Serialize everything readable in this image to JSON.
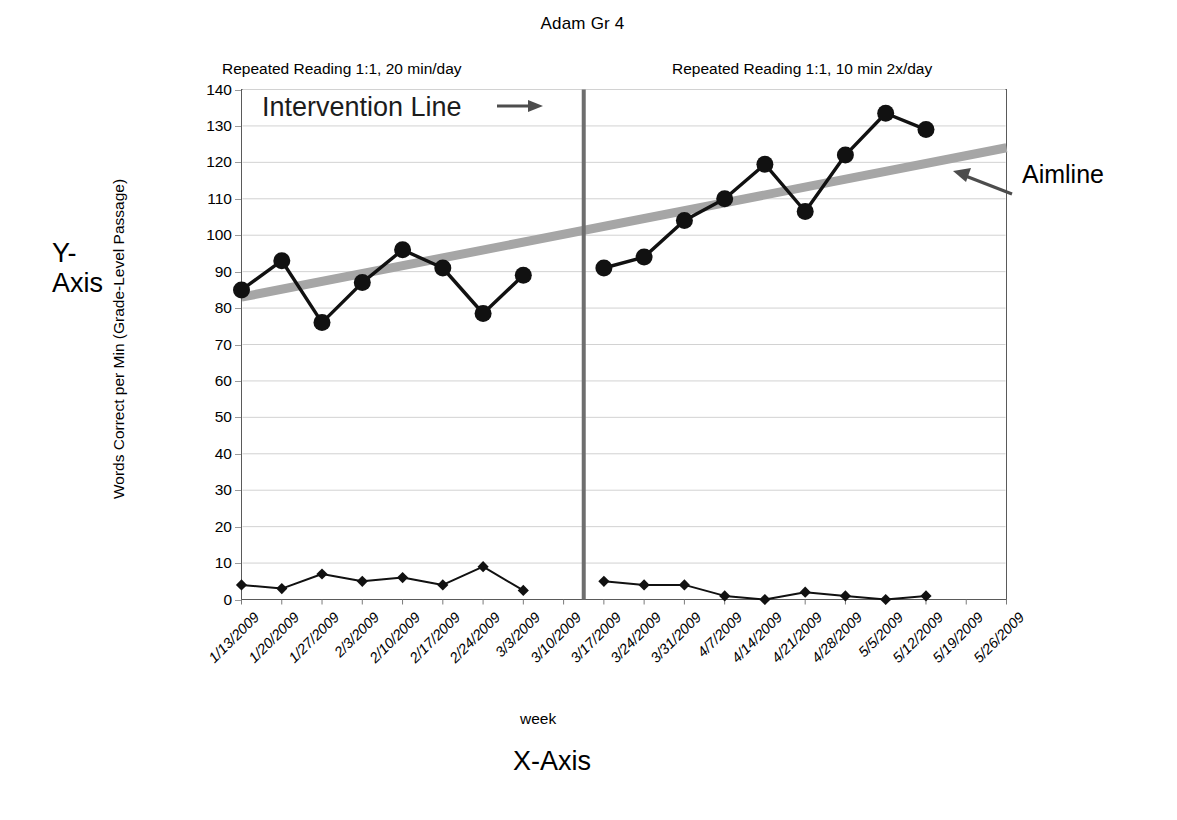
{
  "chart_data": {
    "type": "line",
    "title": "Adam Gr 4",
    "xlabel": "week",
    "ylabel": "Words Correct per Min (Grade-Level Passage)",
    "ylim": [
      0,
      140
    ],
    "ytick_step": 10,
    "yticks": [
      140,
      130,
      120,
      110,
      100,
      90,
      80,
      70,
      60,
      50,
      40,
      30,
      20,
      10,
      0
    ],
    "grid": true,
    "legend_position": "none",
    "categories": [
      "1/13/2009",
      "1/20/2009",
      "1/27/2009",
      "2/3/2009",
      "2/10/2009",
      "2/17/2009",
      "2/24/2009",
      "3/3/2009",
      "3/10/2009",
      "3/17/2009",
      "3/24/2009",
      "3/31/2009",
      "4/7/2009",
      "4/14/2009",
      "4/21/2009",
      "4/28/2009",
      "5/5/2009",
      "5/12/2009",
      "5/19/2009",
      "5/26/2009"
    ],
    "series": [
      {
        "name": "Words Correct per Minute",
        "marker": "circle",
        "values": [
          85,
          93,
          76,
          87,
          96,
          91,
          78.5,
          89,
          null,
          91,
          94,
          104,
          110,
          119.5,
          106.5,
          122,
          133.5,
          129,
          null,
          null
        ]
      },
      {
        "name": "Errors",
        "marker": "diamond",
        "values": [
          4,
          3,
          7,
          5,
          6,
          4,
          9,
          2.5,
          null,
          5,
          4,
          4,
          1,
          0,
          2,
          1,
          0,
          1,
          null,
          null
        ]
      }
    ],
    "trendline": {
      "name": "Aimline",
      "color": "#a6a6a6",
      "start_value": 83,
      "end_value": 124
    },
    "phase_change_line": {
      "name": "Intervention Line",
      "after_category": "3/10/2009",
      "color": "#6e6e6e"
    },
    "phases": [
      {
        "label": "Repeated Reading 1:1, 20 min/day"
      },
      {
        "label": "Repeated Reading 1:1, 10 min 2x/day"
      }
    ],
    "annotations": {
      "intervention": "Intervention Line",
      "aimline": "Aimline",
      "x_axis": "X-Axis",
      "y_axis_line1": "Y-",
      "y_axis_line2": "Axis"
    }
  }
}
